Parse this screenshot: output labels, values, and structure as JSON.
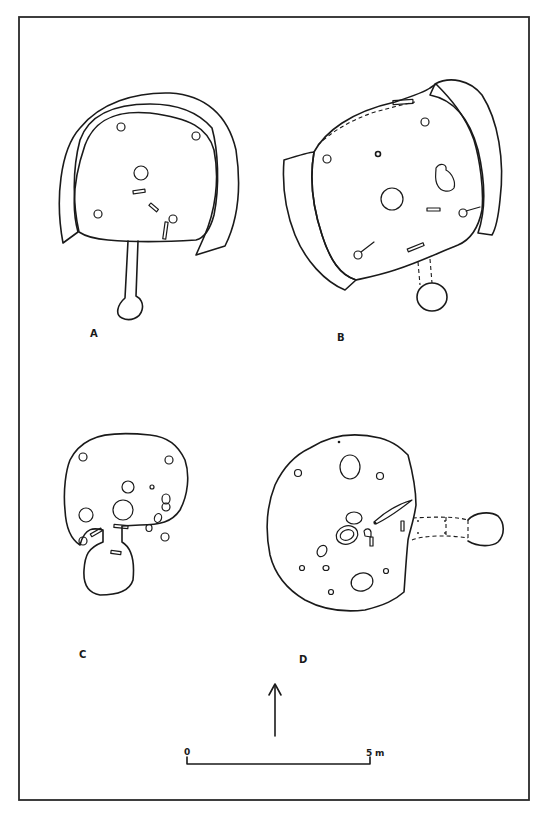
{
  "figure": {
    "plans": [
      {
        "id": "A",
        "label": "A"
      },
      {
        "id": "B",
        "label": "B"
      },
      {
        "id": "C",
        "label": "C"
      },
      {
        "id": "D",
        "label": "D"
      }
    ],
    "north_arrow": {
      "icon": "north-arrow-icon"
    },
    "scale_bar": {
      "start_label": "0",
      "end_label": "5",
      "unit": "m"
    },
    "colors": {
      "ink": "#1a1a1a",
      "background": "#ffffff"
    }
  }
}
